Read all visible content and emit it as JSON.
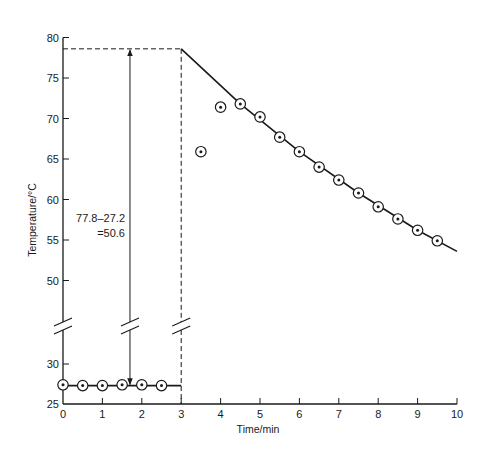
{
  "chart_data": {
    "type": "scatter",
    "title": "",
    "xlabel": "Time/min",
    "ylabel": "Temperature/°C",
    "xlim": [
      0,
      10
    ],
    "ylim_lower_segment": [
      25,
      30
    ],
    "ylim_upper_segment": [
      45,
      80
    ],
    "axis_break": true,
    "grid": false,
    "legend": "none",
    "x_ticks": [
      0,
      1,
      2,
      3,
      4,
      5,
      6,
      7,
      8,
      9,
      10
    ],
    "y_ticks": [
      25,
      30,
      50,
      55,
      60,
      65,
      70,
      75,
      80
    ],
    "series": [
      {
        "name": "initial temperature readings",
        "marker": "circle-dot",
        "x": [
          0,
          0.5,
          1.0,
          1.5,
          2.0,
          2.5
        ],
        "y": [
          27.4,
          27.3,
          27.3,
          27.4,
          27.4,
          27.3
        ]
      },
      {
        "name": "temperature readings after mixing",
        "marker": "circle-dot",
        "x": [
          3.5,
          4.0,
          4.5,
          5.0,
          5.5,
          6.0,
          6.5,
          7.0,
          7.5,
          8.0,
          8.5,
          9.0,
          9.5
        ],
        "y": [
          65.9,
          71.4,
          71.8,
          70.2,
          67.7,
          65.9,
          64.0,
          62.4,
          60.8,
          59.1,
          57.6,
          56.2,
          54.9
        ]
      }
    ],
    "lines": [
      {
        "name": "baseline fit",
        "x": [
          0,
          3
        ],
        "y": [
          27.3,
          27.3
        ]
      },
      {
        "name": "extrapolated cooling curve",
        "x": [
          3.0,
          4.5,
          6.0,
          7.5,
          9.0,
          10.0
        ],
        "y": [
          78.6,
          71.8,
          65.9,
          60.8,
          56.2,
          53.6
        ]
      }
    ],
    "guides": {
      "vertical_dashed_at_x": 3,
      "horizontal_dashed_at_y": 78.6,
      "arrow_x": 1.7
    },
    "annotations": [
      {
        "text_line1": "77.8–27.2",
        "text_line2": "=50.6"
      }
    ]
  }
}
